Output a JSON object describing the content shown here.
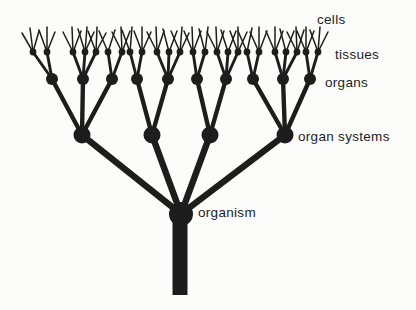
{
  "figure": {
    "width": 416,
    "height": 310,
    "background": "#fcfcfb",
    "ink": "#1d1d1d"
  },
  "hierarchy_order": [
    "organism",
    "organ systems",
    "organs",
    "tissues",
    "cells"
  ],
  "labels": {
    "cells": {
      "text": "cells",
      "x": 317,
      "y": 20
    },
    "tissues": {
      "text": "tissues",
      "x": 335,
      "y": 55
    },
    "organs": {
      "text": "organs",
      "x": 325,
      "y": 83
    },
    "organ_systems": {
      "text": "organ systems",
      "x": 298,
      "y": 137
    },
    "organism": {
      "text": "organism",
      "x": 198,
      "y": 213
    }
  },
  "tree": {
    "organism": {
      "x": 181,
      "y": 214,
      "r": 12
    },
    "trunk": {
      "cx": 180,
      "top": 214,
      "bottom": 295,
      "width": 15
    },
    "levels": {
      "organ_system_y": 135,
      "organ_y": 79,
      "tissue_y": 52
    },
    "node_radii": {
      "organ_system": 8.5,
      "organ": 6,
      "tissue": 3.4
    },
    "stroke_widths": {
      "organism_to_system": 6.5,
      "system_to_organ": 4.4,
      "organ_to_tissue": 2.9,
      "tissue_to_cell": 1.5
    },
    "organ_systems": [
      {
        "x": 82,
        "organs": [
          {
            "x": 52,
            "tissues": [
              {
                "x": 33,
                "cells": [
                  [
                    -11,
                    33
                  ],
                  [
                    -3,
                    28
                  ],
                  [
                    6,
                    31
                  ]
                ]
              },
              {
                "x": 47,
                "cells": [
                  [
                    -8,
                    30
                  ],
                  [
                    0,
                    27
                  ],
                  [
                    8,
                    32
                  ]
                ]
              }
            ]
          },
          {
            "x": 83,
            "tissues": [
              {
                "x": 73,
                "cells": [
                  [
                    -10,
                    32
                  ],
                  [
                    -1,
                    27
                  ],
                  [
                    8,
                    31
                  ]
                ]
              },
              {
                "x": 85,
                "cells": [
                  [
                    -7,
                    29
                  ],
                  [
                    2,
                    27
                  ],
                  [
                    9,
                    32
                  ]
                ]
              },
              {
                "x": 96,
                "cells": [
                  [
                    -8,
                    31
                  ],
                  [
                    1,
                    27
                  ],
                  [
                    10,
                    33
                  ]
                ]
              }
            ]
          },
          {
            "x": 112,
            "tissues": [
              {
                "x": 108,
                "cells": [
                  [
                    -9,
                    31
                  ],
                  [
                    7,
                    30
                  ]
                ]
              },
              {
                "x": 122,
                "cells": [
                  [
                    -10,
                    32
                  ],
                  [
                    -1,
                    27
                  ],
                  [
                    8,
                    31
                  ]
                ]
              }
            ]
          }
        ]
      },
      {
        "x": 152,
        "organs": [
          {
            "x": 137,
            "tissues": [
              {
                "x": 130,
                "cells": [
                  [
                    -8,
                    30
                  ],
                  [
                    2,
                    27
                  ]
                ]
              },
              {
                "x": 142,
                "cells": [
                  [
                    -8,
                    31
                  ],
                  [
                    0,
                    27
                  ],
                  [
                    9,
                    32
                  ]
                ]
              }
            ]
          },
          {
            "x": 168,
            "tissues": [
              {
                "x": 157,
                "cells": [
                  [
                    -10,
                    32
                  ],
                  [
                    -1,
                    27
                  ],
                  [
                    7,
                    31
                  ]
                ]
              },
              {
                "x": 169,
                "cells": [
                  [
                    -6,
                    29
                  ],
                  [
                    8,
                    31
                  ]
                ]
              },
              {
                "x": 180,
                "cells": [
                  [
                    -9,
                    31
                  ],
                  [
                    2,
                    27
                  ],
                  [
                    9,
                    33
                  ]
                ]
              }
            ]
          }
        ]
      },
      {
        "x": 210,
        "organs": [
          {
            "x": 197,
            "tissues": [
              {
                "x": 193,
                "cells": [
                  [
                    -9,
                    31
                  ],
                  [
                    -1,
                    27
                  ],
                  [
                    8,
                    31
                  ]
                ]
              },
              {
                "x": 205,
                "cells": [
                  [
                    -6,
                    29
                  ],
                  [
                    3,
                    27
                  ]
                ]
              }
            ]
          },
          {
            "x": 226,
            "tissues": [
              {
                "x": 217,
                "cells": [
                  [
                    -10,
                    32
                  ],
                  [
                    -1,
                    27
                  ],
                  [
                    7,
                    31
                  ]
                ]
              },
              {
                "x": 228,
                "cells": [
                  [
                    -7,
                    30
                  ],
                  [
                    8,
                    31
                  ]
                ]
              },
              {
                "x": 238,
                "cells": [
                  [
                    -8,
                    31
                  ],
                  [
                    0,
                    27
                  ],
                  [
                    9,
                    32
                  ]
                ]
              }
            ]
          }
        ]
      },
      {
        "x": 285,
        "organs": [
          {
            "x": 253,
            "tissues": [
              {
                "x": 247,
                "cells": [
                  [
                    -9,
                    31
                  ],
                  [
                    5,
                    28
                  ]
                ]
              },
              {
                "x": 259,
                "cells": [
                  [
                    -9,
                    32
                  ],
                  [
                    0,
                    27
                  ],
                  [
                    8,
                    31
                  ]
                ]
              }
            ]
          },
          {
            "x": 283,
            "tissues": [
              {
                "x": 275,
                "cells": [
                  [
                    -9,
                    31
                  ],
                  [
                    0,
                    27
                  ],
                  [
                    8,
                    31
                  ]
                ]
              },
              {
                "x": 286,
                "cells": [
                  [
                    -6,
                    29
                  ],
                  [
                    8,
                    31
                  ]
                ]
              },
              {
                "x": 297,
                "cells": [
                  [
                    -10,
                    32
                  ],
                  [
                    -1,
                    27
                  ],
                  [
                    7,
                    30
                  ]
                ]
              }
            ]
          },
          {
            "x": 310,
            "tissues": [
              {
                "x": 306,
                "cells": [
                  [
                    -9,
                    31
                  ],
                  [
                    0,
                    27
                  ],
                  [
                    8,
                    31
                  ]
                ]
              },
              {
                "x": 318,
                "cells": [
                  [
                    -8,
                    30
                  ],
                  [
                    2,
                    27
                  ],
                  [
                    10,
                    32
                  ]
                ]
              }
            ]
          }
        ]
      }
    ]
  }
}
